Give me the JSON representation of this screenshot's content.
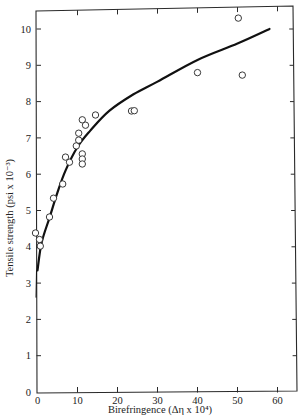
{
  "chart_data": {
    "type": "scatter",
    "title": "",
    "xlabel": "Birefringence (Δη x 10⁴)",
    "ylabel": "Tensile strength (psi x 10⁻³)",
    "xlim": [
      0,
      65
    ],
    "ylim": [
      0,
      10.5
    ],
    "xticks": [
      0,
      10,
      20,
      30,
      40,
      50,
      60
    ],
    "yticks": [
      0,
      1,
      2,
      3,
      4,
      5,
      6,
      7,
      8,
      9,
      10
    ],
    "grid": false,
    "legend": null,
    "series": [
      {
        "name": "measured",
        "kind": "scatter",
        "marker": "open-circle",
        "points": [
          {
            "x": -0.5,
            "y": 4.38
          },
          {
            "x": 0.5,
            "y": 4.2
          },
          {
            "x": 0.7,
            "y": 4.02
          },
          {
            "x": 3.0,
            "y": 4.82
          },
          {
            "x": 4.0,
            "y": 5.34
          },
          {
            "x": 6.3,
            "y": 5.73
          },
          {
            "x": 7.0,
            "y": 6.47
          },
          {
            "x": 8.0,
            "y": 6.33
          },
          {
            "x": 9.7,
            "y": 6.78
          },
          {
            "x": 10.3,
            "y": 6.94
          },
          {
            "x": 10.3,
            "y": 7.13
          },
          {
            "x": 11.2,
            "y": 7.5
          },
          {
            "x": 12.0,
            "y": 7.35
          },
          {
            "x": 11.2,
            "y": 6.56
          },
          {
            "x": 11.2,
            "y": 6.42
          },
          {
            "x": 11.2,
            "y": 6.28
          },
          {
            "x": 14.5,
            "y": 7.63
          },
          {
            "x": 23.5,
            "y": 7.74
          },
          {
            "x": 24.2,
            "y": 7.75
          },
          {
            "x": 40.0,
            "y": 8.8
          },
          {
            "x": 50.2,
            "y": 10.3
          },
          {
            "x": 51.2,
            "y": 8.73
          }
        ]
      },
      {
        "name": "fit curve",
        "kind": "line",
        "points": [
          {
            "x": 0.0,
            "y": 3.35
          },
          {
            "x": 1.0,
            "y": 4.1
          },
          {
            "x": 3.0,
            "y": 4.8
          },
          {
            "x": 5.0,
            "y": 5.5
          },
          {
            "x": 7.0,
            "y": 6.1
          },
          {
            "x": 10.0,
            "y": 6.75
          },
          {
            "x": 13.2,
            "y": 7.2
          },
          {
            "x": 18.0,
            "y": 7.75
          },
          {
            "x": 24.0,
            "y": 8.2
          },
          {
            "x": 30.0,
            "y": 8.55
          },
          {
            "x": 40.0,
            "y": 9.15
          },
          {
            "x": 50.0,
            "y": 9.6
          },
          {
            "x": 58.0,
            "y": 10.0
          }
        ]
      }
    ]
  }
}
